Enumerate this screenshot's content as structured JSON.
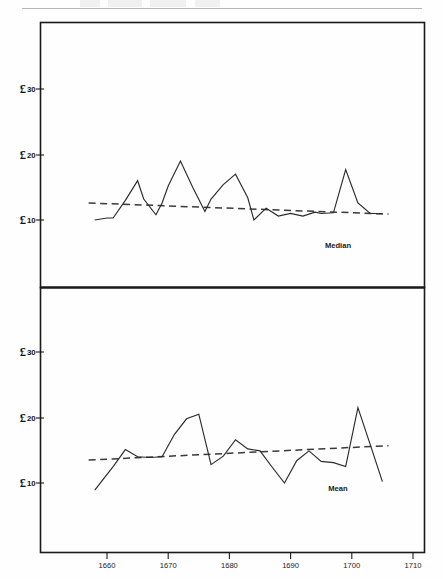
{
  "page": {
    "background_color": "#fefefe",
    "ink_color": "#1a1a1a"
  },
  "figure": {
    "currency_symbol": "£",
    "panels": [
      {
        "name": "median",
        "label": "Median"
      },
      {
        "name": "mean",
        "label": "Mean"
      }
    ]
  },
  "chart_data": [
    {
      "type": "line",
      "title": "Median",
      "xlabel": "",
      "ylabel": "£",
      "xlim": [
        1656,
        1712
      ],
      "ylim": [
        0,
        36
      ],
      "grid": false,
      "legend": "inline-label",
      "legend_position": "bottom-right",
      "yticks": [
        10,
        20,
        30
      ],
      "ytick_labels": [
        "£ 10",
        "£ 20",
        "£ 30"
      ],
      "xticks": [
        1660,
        1670,
        1680,
        1690,
        1700,
        1710
      ],
      "xtick_labels": [
        "1660",
        "1670",
        "1680",
        "1690",
        "1700",
        "1710"
      ],
      "series": [
        {
          "name": "Median",
          "style": "solid",
          "x": [
            1658,
            1660,
            1661,
            1663,
            1665,
            1666,
            1668,
            1669,
            1670,
            1672,
            1674,
            1676,
            1677,
            1679,
            1681,
            1683,
            1684,
            1686,
            1688,
            1690,
            1692,
            1694,
            1695,
            1697,
            1699,
            1701,
            1703,
            1705
          ],
          "y": [
            10.0,
            10.3,
            10.3,
            13.0,
            16.0,
            13.2,
            10.8,
            12.6,
            15.2,
            19.0,
            15.0,
            11.3,
            13.2,
            15.4,
            17.0,
            13.4,
            10.0,
            11.8,
            10.6,
            11.0,
            10.6,
            11.2,
            11.0,
            11.1,
            17.7,
            12.6,
            11.0,
            11.0
          ]
        },
        {
          "name": "Median trend",
          "style": "dashed",
          "x": [
            1657,
            1706
          ],
          "y": [
            12.6,
            10.9
          ]
        }
      ]
    },
    {
      "type": "line",
      "title": "Mean",
      "xlabel": "",
      "ylabel": "£",
      "xlim": [
        1656,
        1712
      ],
      "ylim": [
        0,
        36
      ],
      "grid": false,
      "legend": "inline-label",
      "legend_position": "bottom-right",
      "yticks": [
        10,
        20,
        30
      ],
      "ytick_labels": [
        "£ 10",
        "£ 20",
        "£ 30"
      ],
      "xticks": [
        1660,
        1670,
        1680,
        1690,
        1700,
        1710
      ],
      "xtick_labels": [
        "1660",
        "1670",
        "1680",
        "1690",
        "1700",
        "1710"
      ],
      "series": [
        {
          "name": "Mean",
          "style": "solid",
          "x": [
            1658,
            1661,
            1663,
            1665,
            1667,
            1669,
            1671,
            1673,
            1675,
            1677,
            1679,
            1681,
            1683,
            1685,
            1687,
            1689,
            1691,
            1693,
            1695,
            1697,
            1699,
            1701,
            1703,
            1705
          ],
          "y": [
            8.9,
            12.5,
            15.1,
            14.0,
            13.9,
            14.0,
            17.4,
            19.8,
            20.5,
            12.8,
            14.1,
            16.6,
            15.2,
            14.9,
            12.4,
            10.0,
            13.4,
            14.9,
            13.3,
            13.1,
            12.5,
            21.5,
            15.9,
            10.2
          ]
        },
        {
          "name": "Mean trend",
          "style": "dashed",
          "x": [
            1657,
            1706
          ],
          "y": [
            13.5,
            15.7
          ]
        }
      ]
    }
  ]
}
